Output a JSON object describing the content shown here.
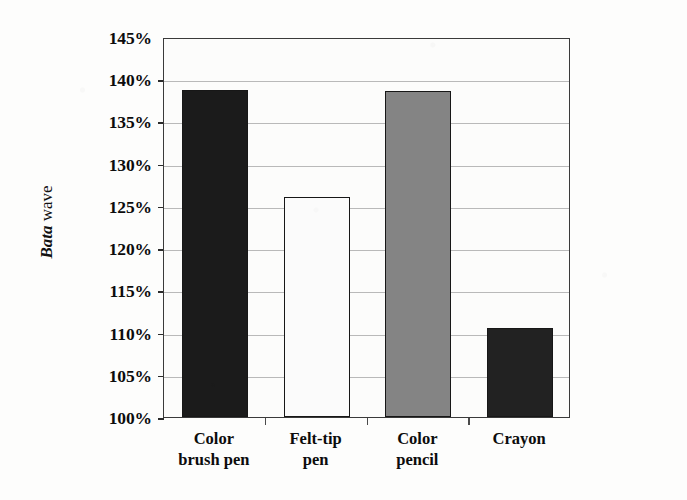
{
  "chart_data": {
    "type": "bar",
    "title": "",
    "xlabel": "",
    "ylabel": "Bata wave",
    "ylabel_italic_part": "Bata",
    "ylabel_roman_part": "wave",
    "categories": [
      "Color brush pen",
      "Felt-tip pen",
      "Color pencil",
      "Crayon"
    ],
    "category_lines": [
      [
        "Color",
        "brush pen"
      ],
      [
        "Felt-tip",
        "pen"
      ],
      [
        "Color",
        "pencil"
      ],
      [
        "Crayon",
        ""
      ]
    ],
    "values": [
      138.7,
      126.0,
      138.6,
      110.5
    ],
    "value_labels": [
      "138.7%",
      "126.0%",
      "138.6%",
      "110.5%"
    ],
    "ylim": [
      100,
      145
    ],
    "ytick_values": [
      145,
      140,
      135,
      130,
      125,
      120,
      115,
      110,
      105,
      100
    ],
    "ytick_labels": [
      "145%",
      "140%",
      "135%",
      "130%",
      "125%",
      "120%",
      "115%",
      "110%",
      "105%",
      "100%"
    ],
    "grid": true,
    "grid_axis": "y",
    "legend": false,
    "legend_position": "none",
    "bar_colors": [
      "#1b1b1b",
      "#fbfbfb",
      "#848484",
      "#222222"
    ],
    "bar_edge_color": "#171717",
    "plot_background": "#fcfcfb",
    "gridline_color": "#b9b9b9",
    "axis_color": "#3a3a3a",
    "text_color": "#0c0c0c"
  }
}
